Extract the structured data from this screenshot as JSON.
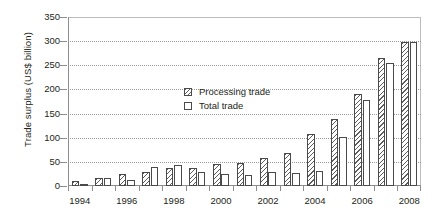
{
  "chart_data": {
    "type": "bar",
    "title": "",
    "xlabel": "",
    "ylabel": "Trade surplus (US$ billion)",
    "categories": [
      "1994",
      "1995",
      "1996",
      "1997",
      "1998",
      "1999",
      "2000",
      "2001",
      "2002",
      "2003",
      "2004",
      "2005",
      "2006",
      "2007",
      "2008"
    ],
    "series": [
      {
        "name": "Processing trade",
        "values": [
          10,
          17,
          25,
          29,
          37,
          37,
          45,
          47,
          58,
          68,
          107,
          139,
          190,
          265,
          298
        ]
      },
      {
        "name": "Total trade",
        "values": [
          5,
          17,
          12,
          40,
          43,
          29,
          24,
          23,
          30,
          26,
          32,
          102,
          178,
          255,
          298
        ]
      }
    ],
    "ylim": [
      0,
      350
    ],
    "yticks": [
      0,
      50,
      100,
      150,
      200,
      250,
      300,
      350
    ],
    "xticks": [
      "1994",
      "1996",
      "1998",
      "2000",
      "2002",
      "2004",
      "2006",
      "2008"
    ],
    "grid": "horizontal-dotted",
    "legend_position": "upper-left-inside",
    "colors": {
      "processing_hatch": "#5e5e5e",
      "total_fill": "#ffffff",
      "bar_outline": "#4a4a4a",
      "axis": "#8d8d8d",
      "grid": "#9a9a9a",
      "text": "#231f20"
    }
  },
  "legend": {
    "items": [
      {
        "label": "Processing trade",
        "swatch": "hatched-swatch"
      },
      {
        "label": "Total trade",
        "swatch": "open-swatch"
      }
    ]
  }
}
